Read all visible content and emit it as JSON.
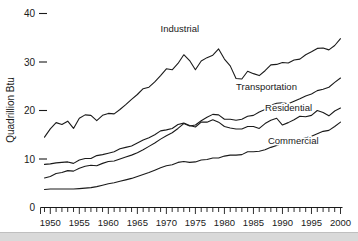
{
  "chart_data": {
    "type": "line",
    "title": "",
    "xlabel": "",
    "ylabel": "Quadrillion Btu",
    "xlim": [
      1949,
      2000
    ],
    "ylim": [
      0,
      42
    ],
    "yticks": [
      0,
      10,
      20,
      30,
      40
    ],
    "ytick_labels": [
      "0",
      "10",
      "20",
      "30",
      "40"
    ],
    "xticks": [
      1950,
      1955,
      1960,
      1965,
      1970,
      1975,
      1980,
      1985,
      1990,
      1995,
      2000
    ],
    "xtick_labels": [
      "1950",
      "1955",
      "1960",
      "1965",
      "1970",
      "1975",
      "1980",
      "1985",
      "1990",
      "1995",
      "2000"
    ],
    "x_minor_tick_interval": 1,
    "grid": false,
    "legend_position": "inline-annotations",
    "line_color": "#1a1a1a",
    "background_color": "#ffffff",
    "x": [
      1949,
      1950,
      1951,
      1952,
      1953,
      1954,
      1955,
      1956,
      1957,
      1958,
      1959,
      1960,
      1961,
      1962,
      1963,
      1964,
      1965,
      1966,
      1967,
      1968,
      1969,
      1970,
      1971,
      1972,
      1973,
      1974,
      1975,
      1976,
      1977,
      1978,
      1979,
      1980,
      1981,
      1982,
      1983,
      1984,
      1985,
      1986,
      1987,
      1988,
      1989,
      1990,
      1991,
      1992,
      1993,
      1994,
      1995,
      1996,
      1997,
      1998,
      1999,
      2000
    ],
    "series": [
      {
        "name": "Industrial",
        "label": "Industrial",
        "label_x": 1969.0,
        "label_y": 36.2,
        "values": [
          14.5,
          16.2,
          17.5,
          17.1,
          17.8,
          16.3,
          18.4,
          19.1,
          19.0,
          17.9,
          19.0,
          19.4,
          19.3,
          20.2,
          21.2,
          22.3,
          23.3,
          24.5,
          24.8,
          25.9,
          27.2,
          28.6,
          28.4,
          29.7,
          31.5,
          30.3,
          28.4,
          30.2,
          30.9,
          31.4,
          32.7,
          30.6,
          29.2,
          26.6,
          26.5,
          28.1,
          27.6,
          27.2,
          28.2,
          29.4,
          29.5,
          29.9,
          29.8,
          30.4,
          30.6,
          31.5,
          32.1,
          32.8,
          32.9,
          32.5,
          33.4,
          34.8
        ]
      },
      {
        "name": "Transportation",
        "label": "Transportation",
        "label_x": 1982.0,
        "label_y": 24.2,
        "values": [
          6.1,
          6.4,
          7.0,
          7.2,
          7.6,
          7.5,
          8.1,
          8.5,
          8.7,
          8.6,
          9.1,
          9.5,
          9.6,
          10.0,
          10.4,
          10.8,
          11.3,
          11.9,
          12.6,
          13.3,
          14.1,
          14.8,
          15.4,
          16.3,
          17.3,
          16.8,
          17.0,
          17.9,
          18.6,
          19.2,
          19.1,
          18.2,
          18.2,
          18.0,
          18.2,
          18.8,
          19.0,
          19.7,
          20.2,
          21.1,
          21.5,
          21.6,
          21.4,
          21.9,
          22.4,
          23.0,
          23.4,
          24.1,
          24.4,
          24.8,
          25.8,
          26.7
        ]
      },
      {
        "name": "Residential",
        "label": "Residential",
        "label_x": 1987.0,
        "label_y": 20.0,
        "values": [
          8.9,
          9.0,
          9.2,
          9.3,
          9.4,
          9.1,
          9.8,
          10.1,
          10.1,
          10.7,
          10.9,
          11.2,
          11.5,
          12.1,
          12.4,
          12.7,
          13.3,
          13.9,
          14.4,
          15.0,
          15.8,
          16.0,
          16.3,
          17.1,
          17.4,
          16.9,
          16.6,
          17.6,
          17.6,
          18.1,
          17.6,
          16.7,
          16.4,
          16.2,
          16.2,
          16.7,
          16.7,
          16.3,
          17.3,
          18.0,
          18.4,
          17.0,
          17.5,
          18.1,
          18.8,
          18.7,
          19.0,
          20.0,
          19.6,
          18.9,
          19.9,
          20.5
        ]
      },
      {
        "name": "Commercial",
        "label": "Commercial",
        "label_x": 1987.5,
        "label_y": 13.0,
        "values": [
          3.7,
          3.8,
          3.8,
          3.8,
          3.8,
          3.8,
          3.9,
          4.0,
          4.1,
          4.3,
          4.6,
          4.9,
          5.1,
          5.4,
          5.7,
          6.0,
          6.4,
          6.8,
          7.2,
          7.7,
          8.2,
          8.6,
          8.8,
          9.3,
          9.5,
          9.3,
          9.4,
          9.8,
          9.9,
          10.2,
          10.2,
          10.6,
          10.8,
          10.8,
          10.9,
          11.5,
          11.5,
          11.6,
          11.9,
          12.4,
          12.8,
          13.3,
          13.5,
          13.5,
          14.0,
          14.4,
          14.7,
          15.2,
          15.7,
          15.9,
          16.7,
          17.6
        ]
      }
    ]
  },
  "axes": {
    "y_axis_title": "Quadrillion Btu"
  }
}
